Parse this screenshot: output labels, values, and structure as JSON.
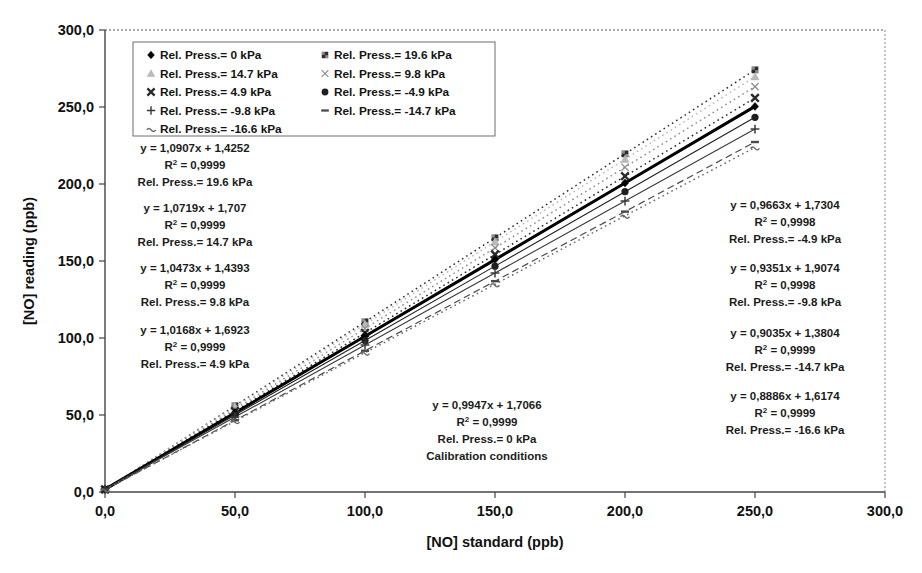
{
  "chart_data": {
    "type": "scatter",
    "title": "",
    "xlabel": "[NO] standard (ppb)",
    "ylabel": "[NO] reading (ppb)",
    "xlim": [
      0,
      300
    ],
    "ylim": [
      0,
      300
    ],
    "xticks": [
      "0,0",
      "50,0",
      "100,0",
      "150,0",
      "200,0",
      "250,0",
      "300,0"
    ],
    "yticks": [
      "0,0",
      "50,0",
      "100,0",
      "150,0",
      "200,0",
      "250,0",
      "300,0"
    ],
    "xtick_values": [
      0,
      50,
      100,
      150,
      200,
      250,
      300
    ],
    "ytick_values": [
      0,
      50,
      100,
      150,
      200,
      250,
      300
    ],
    "grid": false,
    "legend_position": "top-left-inside",
    "x": [
      0,
      50,
      100,
      150,
      200,
      250
    ],
    "series": [
      {
        "name": "Rel. Press.= 19.6 kPa",
        "marker": "square-filled",
        "color": "#2e2e2e",
        "line": "dotted",
        "slope": 1.0907,
        "intercept": 1.4252,
        "r2": "0,9999",
        "values": [
          1.43,
          55.96,
          110.5,
          165.03,
          219.57,
          274.1
        ]
      },
      {
        "name": "Rel. Press.= 14.7 kPa",
        "marker": "triangle",
        "color": "#b9b9b9",
        "line": "dotted",
        "slope": 1.0719,
        "intercept": 1.707,
        "r2": "0,9999",
        "values": [
          1.71,
          55.3,
          108.9,
          162.49,
          216.09,
          269.68
        ]
      },
      {
        "name": "Rel. Press.= 9.8 kPa",
        "marker": "x-cross",
        "color": "#8f8f8f",
        "line": "dotted",
        "slope": 1.0473,
        "intercept": 1.4393,
        "r2": "0,9999",
        "values": [
          1.44,
          53.81,
          106.17,
          158.53,
          210.9,
          263.26
        ]
      },
      {
        "name": "Rel. Press.= 4.9 kPa",
        "marker": "bold-x",
        "color": "#2a2a2a",
        "line": "dotted",
        "slope": 1.0168,
        "intercept": 1.6923,
        "r2": "0,9999",
        "values": [
          1.69,
          52.53,
          103.37,
          154.21,
          205.05,
          255.89
        ]
      },
      {
        "name": "Rel. Press.= 0 kPa",
        "marker": "diamond-filled",
        "color": "#000000",
        "line": "solid-bold",
        "slope": 0.9947,
        "intercept": 1.7066,
        "r2": "0,9999",
        "note": "Calibration conditions",
        "values": [
          1.71,
          51.44,
          101.18,
          150.91,
          200.65,
          250.38
        ]
      },
      {
        "name": "Rel. Press.= -4.9 kPa",
        "marker": "circle-filled",
        "color": "#1f1f1f",
        "line": "solid-thin",
        "slope": 0.9663,
        "intercept": 1.7304,
        "r2": "0,9998",
        "values": [
          1.73,
          50.05,
          98.36,
          146.67,
          194.99,
          243.3
        ]
      },
      {
        "name": "Rel. Press.= -9.8 kPa",
        "marker": "plus",
        "color": "#3a3a3a",
        "line": "solid-thin",
        "slope": 0.9351,
        "intercept": 1.9074,
        "r2": "0,9998",
        "values": [
          1.91,
          48.66,
          95.42,
          142.17,
          188.93,
          235.68
        ]
      },
      {
        "name": "Rel. Press.= -14.7 kPa",
        "marker": "dash",
        "color": "#4a4a4a",
        "line": "dashed",
        "slope": 0.9035,
        "intercept": 1.3804,
        "r2": "0,9999",
        "values": [
          1.38,
          46.56,
          91.73,
          136.91,
          182.08,
          227.26
        ]
      },
      {
        "name": "Rel. Press.= -16.6 kPa",
        "marker": "tilde-dash",
        "color": "#6a6a6a",
        "line": "dotted",
        "slope": 0.8886,
        "intercept": 1.6174,
        "r2": "0,9999",
        "values": [
          1.62,
          46.05,
          90.48,
          134.91,
          179.34,
          223.77
        ]
      }
    ],
    "annotations": [
      {
        "id": "eq-19-6",
        "side": "left",
        "line1": "y = 1,0907x + 1,4252",
        "line2_pre": "R",
        "line2_sup": "2",
        "line2_post": " = 0,9999",
        "line3": "Rel. Press.= 19.6 kPa",
        "line4": ""
      },
      {
        "id": "eq-14-7",
        "side": "left",
        "line1": "y = 1,0719x + 1,707",
        "line2_pre": "R",
        "line2_sup": "2",
        "line2_post": " = 0,9999",
        "line3": "Rel. Press.= 14.7 kPa",
        "line4": ""
      },
      {
        "id": "eq-9-8",
        "side": "left",
        "line1": "y = 1,0473x + 1,4393",
        "line2_pre": "R",
        "line2_sup": "2",
        "line2_post": " = 0,9999",
        "line3": "Rel. Press.= 9.8 kPa",
        "line4": ""
      },
      {
        "id": "eq-4-9",
        "side": "left",
        "line1": "y = 1,0168x + 1,6923",
        "line2_pre": "R",
        "line2_sup": "2",
        "line2_post": " = 0,9999",
        "line3": "Rel. Press.= 4.9 kPa",
        "line4": ""
      },
      {
        "id": "eq-0",
        "side": "center",
        "line1": "y = 0,9947x + 1,7066",
        "line2_pre": "R",
        "line2_sup": "2",
        "line2_post": " = 0,9999",
        "line3": "Rel. Press.= 0 kPa",
        "line4": "Calibration conditions"
      },
      {
        "id": "eq-m4-9",
        "side": "right",
        "line1": "y = 0,9663x + 1,7304",
        "line2_pre": "R",
        "line2_sup": "2",
        "line2_post": " = 0,9998",
        "line3": "Rel. Press.= -4.9 kPa",
        "line4": ""
      },
      {
        "id": "eq-m9-8",
        "side": "right",
        "line1": "y = 0,9351x + 1,9074",
        "line2_pre": "R",
        "line2_sup": "2",
        "line2_post": " = 0,9998",
        "line3": "Rel. Press.= -9.8 kPa",
        "line4": ""
      },
      {
        "id": "eq-m14-7",
        "side": "right",
        "line1": "y = 0,9035x + 1,3804",
        "line2_pre": "R",
        "line2_sup": "2",
        "line2_post": " = 0,9999",
        "line3": "Rel. Press.= -14.7 kPa",
        "line4": ""
      },
      {
        "id": "eq-m16-6",
        "side": "right",
        "line1": "y = 0,8886x + 1,6174",
        "line2_pre": "R",
        "line2_sup": "2",
        "line2_post": " = 0,9999",
        "line3": "Rel. Press.= -16.6 kPa",
        "line4": ""
      }
    ]
  },
  "legend": {
    "entries": [
      {
        "label": "Rel. Press.= 0 kPa",
        "marker": "diamond-filled",
        "col": 0,
        "row": 0
      },
      {
        "label": "Rel. Press.= 19.6 kPa",
        "marker": "square-filled",
        "col": 1,
        "row": 0
      },
      {
        "label": "Rel. Press.= 14.7 kPa",
        "marker": "triangle",
        "col": 0,
        "row": 1
      },
      {
        "label": "Rel. Press.= 9.8 kPa",
        "marker": "x-cross",
        "col": 1,
        "row": 1
      },
      {
        "label": "Rel. Press.= 4.9 kPa",
        "marker": "bold-x",
        "col": 0,
        "row": 2
      },
      {
        "label": "Rel. Press.= -4.9 kPa",
        "marker": "circle-filled",
        "col": 1,
        "row": 2
      },
      {
        "label": "Rel. Press.= -9.8 kPa",
        "marker": "plus",
        "col": 0,
        "row": 3
      },
      {
        "label": "Rel. Press.= -14.7 kPa",
        "marker": "dash",
        "col": 1,
        "row": 3
      },
      {
        "label": "Rel. Press.= -16.6 kPa",
        "marker": "tilde-dash",
        "col": 0,
        "row": 4
      }
    ]
  },
  "axes": {
    "x_title": "[NO] standard (ppb)",
    "y_title": "[NO] reading (ppb)"
  }
}
